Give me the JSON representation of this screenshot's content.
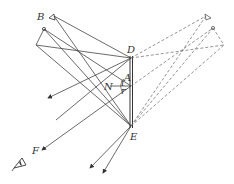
{
  "labels": {
    "B": "B",
    "D": "D",
    "A": "A",
    "N": "N",
    "i": "i",
    "r": "r",
    "E": "E",
    "F": "F"
  },
  "figure": {
    "mirror": {
      "top": "D",
      "bottom": "E"
    },
    "object": "B",
    "observer_eye": "eye-icon",
    "virtual_image": "dashed reflection"
  }
}
